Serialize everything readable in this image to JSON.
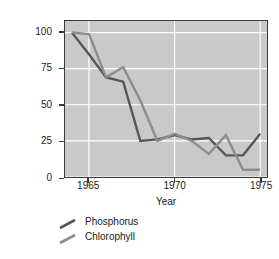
{
  "chart_data": {
    "type": "line",
    "title": "",
    "xlabel": "Year",
    "ylabel": "Percent of maximum level\n(the year 1964 = 100%)",
    "xlim": [
      1963.6,
      1975.4
    ],
    "ylim": [
      0,
      108
    ],
    "xticks": [
      1965,
      1970,
      1975
    ],
    "xtick_labels": [
      "1965",
      "1970",
      "1975"
    ],
    "yticks": [
      0,
      25,
      50,
      75,
      100
    ],
    "ytick_labels": [
      "0",
      "25",
      "50",
      "75",
      "100"
    ],
    "grid": true,
    "grid_color": "#ffffff",
    "plot_background": "#c9c9c9",
    "legend_position": "below-left",
    "x": [
      1964,
      1965,
      1966,
      1967,
      1968,
      1969,
      1970,
      1971,
      1972,
      1973,
      1974,
      1975
    ],
    "series": [
      {
        "name": "Phosphorus",
        "color": "#575757",
        "values": [
          100,
          85,
          69,
          66,
          25,
          26,
          29,
          26,
          27,
          15,
          15,
          30
        ]
      },
      {
        "name": "Chlorophyll",
        "color": "#8d8d8d",
        "values": [
          100,
          99,
          69,
          76,
          53,
          25,
          30,
          25,
          16,
          29,
          5,
          5
        ]
      }
    ]
  },
  "axes": {
    "y_title": "Percent of maximum level\n(the year 1964 = 100%)",
    "x_title": "Year"
  },
  "legend": {
    "items": [
      {
        "label": "Phosphorus",
        "color": "#575757"
      },
      {
        "label": "Chlorophyll",
        "color": "#8d8d8d"
      }
    ]
  }
}
